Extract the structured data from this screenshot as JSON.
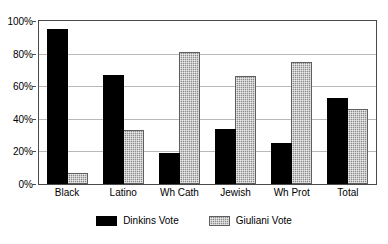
{
  "chart_data": {
    "type": "bar",
    "title": "",
    "subtitle": "",
    "xlabel": "",
    "ylabel": "",
    "categories": [
      "Black",
      "Latino",
      "Wh Cath",
      "Jewish",
      "Wh Prot",
      "Total"
    ],
    "series": [
      {
        "name": "Dinkins Vote",
        "color": "#000000",
        "values": [
          95,
          67,
          19,
          34,
          25,
          53
        ]
      },
      {
        "name": "Giuliani Vote",
        "color": "#8c8c8c",
        "values": [
          7,
          33,
          81,
          66,
          75,
          46
        ]
      }
    ],
    "ylim": [
      0,
      100
    ],
    "y_ticks": [
      0,
      20,
      40,
      60,
      80,
      100
    ],
    "y_tick_labels": [
      "0%",
      "20%",
      "40%",
      "60%",
      "80%",
      "100%"
    ],
    "grid": true,
    "legend_position": "bottom"
  }
}
